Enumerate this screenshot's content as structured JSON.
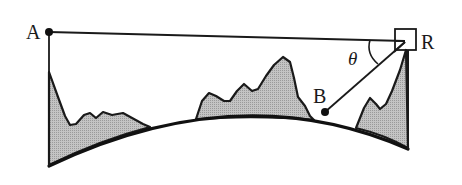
{
  "diagram": {
    "labels": {
      "point_a": "A",
      "point_b": "B",
      "receiver": "R",
      "angle": "θ"
    },
    "colors": {
      "line": "#1a1a1a",
      "terrain_fill": "#b8b8b8",
      "background": "#ffffff"
    },
    "elements": [
      "line-of-sight A to R",
      "line B to R",
      "receiver box R",
      "angle arc theta",
      "earth curvature",
      "terrain mountains"
    ]
  }
}
